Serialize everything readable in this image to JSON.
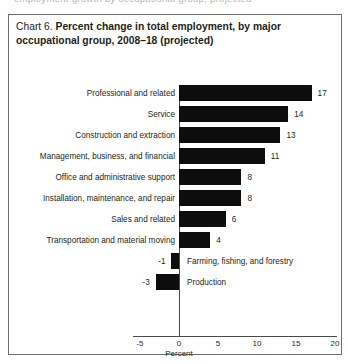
{
  "page": {
    "bleed_text": "employment growth by occupational group, projected"
  },
  "chart_box": {
    "label_prefix": "Chart 6.",
    "title": "Percent change in total employment, by major occupational group, 2008–18 (projected)"
  },
  "chart_data": {
    "type": "bar",
    "orientation": "horizontal",
    "title": "Percent change in total employment, by major occupational group, 2008–18 (projected)",
    "xlabel": "Percent",
    "ylabel": "",
    "xlim": [
      -5,
      20
    ],
    "xticks": [
      -5,
      0,
      5,
      10,
      15,
      20
    ],
    "xtick_labels": [
      "-5",
      "0",
      "5",
      "10",
      "15",
      "20"
    ],
    "grid": false,
    "legend": null,
    "bar_color": "#0d0d0d",
    "categories": [
      "Professional and related",
      "Service",
      "Construction and extraction",
      "Management, business, and financial",
      "Office and administrative support",
      "Installation, maintenance, and repair",
      "Sales and related",
      "Transportation and material moving",
      "Farming, fishing, and forestry",
      "Production"
    ],
    "values": [
      17,
      14,
      13,
      11,
      8,
      8,
      6,
      4,
      -1,
      -3
    ],
    "value_labels": [
      "17",
      "14",
      "13",
      "11",
      "8",
      "8",
      "6",
      "4",
      "-1",
      "-3"
    ]
  }
}
